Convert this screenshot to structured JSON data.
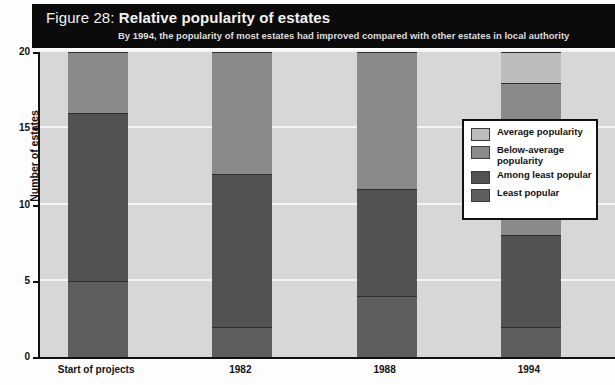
{
  "figure": {
    "number_label": "Figure 28:",
    "title": "Relative popularity of estates",
    "subtitle": "By 1994, the popularity of most estates had improved compared with other estates in local authority"
  },
  "legend": {
    "items": [
      {
        "label": "Average popularity",
        "color": "#bcbcbc"
      },
      {
        "label": "Below-average popularity",
        "color": "#8a8a8a"
      },
      {
        "label": "Among least popular",
        "color": "#525252"
      },
      {
        "label": "Least popular",
        "color": "#5e5e5e"
      }
    ]
  },
  "chart_data": {
    "type": "bar",
    "stacked": true,
    "title": "Relative popularity of estates",
    "subtitle": "By 1994, the popularity of most estates had improved compared with other estates in local authority",
    "xlabel": "",
    "ylabel": "Number of estates",
    "ylim": [
      0,
      20
    ],
    "yticks": [
      0,
      5,
      10,
      15,
      20
    ],
    "grid": true,
    "legend_position": "right",
    "categories": [
      "Start of projects",
      "1982",
      "1988",
      "1994"
    ],
    "series": [
      {
        "name": "Least popular",
        "color": "#5e5e5e",
        "values": [
          5,
          2,
          4,
          2
        ]
      },
      {
        "name": "Among least popular",
        "color": "#525252",
        "values": [
          11,
          10,
          7,
          6
        ]
      },
      {
        "name": "Below-average popularity",
        "color": "#8a8a8a",
        "values": [
          4,
          8,
          9,
          10
        ]
      },
      {
        "name": "Average popularity",
        "color": "#bcbcbc",
        "values": [
          0,
          0,
          0,
          2
        ]
      }
    ],
    "totals": [
      20,
      20,
      20,
      20
    ],
    "plot_background": "#d7d7d7",
    "gridline_color": "#f4f4f4"
  }
}
